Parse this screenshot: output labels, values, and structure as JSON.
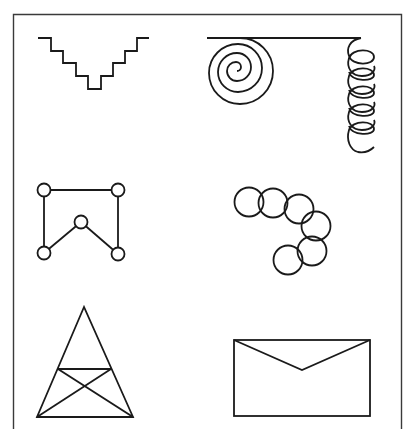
{
  "figure": {
    "frame": {
      "left": 13,
      "top": 14,
      "right": 401,
      "bottom_open": true
    },
    "ink_color": "#1a1a1a",
    "frame_color": "#3a3a3a",
    "background": "#ffffff"
  },
  "shapes": [
    {
      "id": "staircase",
      "row": 1,
      "col": 1,
      "label": "V-shaped staircase line"
    },
    {
      "id": "spiral-and-coil",
      "row": 1,
      "col": 2,
      "label": "Horizontal line with spiral at left end and helical coil hanging from right end"
    },
    {
      "id": "node-graph",
      "row": 2,
      "col": 1,
      "label": "Five small circles connected by lines forming an M/house-like outline"
    },
    {
      "id": "chained-circles",
      "row": 2,
      "col": 2,
      "label": "Six overlapping circles forming a hook-shaped chain"
    },
    {
      "id": "triangle-crossed",
      "row": 3,
      "col": 1,
      "label": "Triangle with horizontal crossbar and two diagonals forming an X"
    },
    {
      "id": "envelope",
      "row": 3,
      "col": 2,
      "label": "Envelope: rectangle with V-shaped flap"
    }
  ]
}
